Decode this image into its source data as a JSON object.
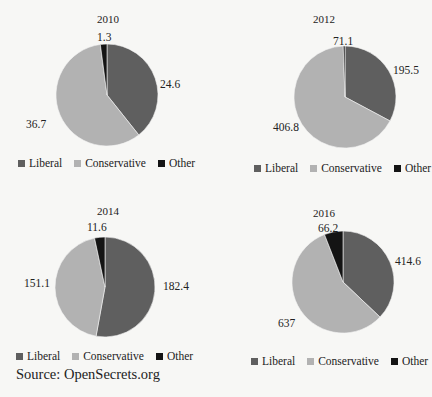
{
  "colors": {
    "liberal": "#5f5f5f",
    "conservative": "#b2b2b2",
    "other": "#141414"
  },
  "legend": {
    "liberal": "Liberal",
    "conservative": "Conservative",
    "other": "Other"
  },
  "source": "Source: OpenSecrets.org",
  "chart_data": [
    {
      "type": "pie",
      "title": "2010",
      "categories": [
        "Liberal",
        "Conservative",
        "Other"
      ],
      "values": [
        24.6,
        36.7,
        1.3
      ],
      "labels": [
        "24.6",
        "36.7",
        "1.3"
      ],
      "legend_position": "bottom"
    },
    {
      "type": "pie",
      "title": "2012",
      "categories": [
        "Liberal",
        "Conservative",
        "Other"
      ],
      "values": [
        195.5,
        406.8,
        71.1
      ],
      "labels": [
        "195.5",
        "406.8",
        "71.1"
      ],
      "legend_position": "bottom"
    },
    {
      "type": "pie",
      "title": "2014",
      "categories": [
        "Liberal",
        "Conservative",
        "Other"
      ],
      "values": [
        182.4,
        151.1,
        11.6
      ],
      "labels": [
        "182.4",
        "151.1",
        "11.6"
      ],
      "legend_position": "bottom"
    },
    {
      "type": "pie",
      "title": "2016",
      "categories": [
        "Liberal",
        "Conservative",
        "Other"
      ],
      "values": [
        414.6,
        637,
        66.2
      ],
      "labels": [
        "414.6",
        "637",
        "66.2"
      ],
      "legend_position": "bottom"
    }
  ],
  "panels": [
    {
      "cx": 107,
      "cy": 95,
      "r": 51,
      "angles": [
        141.5,
        211,
        7.5
      ],
      "title_pos": [
        0,
        13
      ],
      "label_pos": [
        [
          160,
          78
        ],
        [
          26,
          118
        ],
        [
          97,
          31
        ]
      ],
      "legend_pos": [
        18,
        157
      ]
    },
    {
      "cx": 345,
      "cy": 97,
      "r": 51,
      "angles": [
        118,
        240,
        2
      ],
      "title_pos": [
        216,
        13
      ],
      "label_pos": [
        [
          393,
          64
        ],
        [
          273,
          121
        ],
        [
          333,
          35
        ]
      ],
      "legend_pos": [
        254,
        162
      ]
    },
    {
      "cx": 105,
      "cy": 287,
      "r": 50,
      "angles": [
        190.3,
        157.6,
        12.1
      ],
      "title_pos": [
        0,
        205
      ],
      "label_pos": [
        [
          163,
          280
        ],
        [
          24,
          277
        ],
        [
          87,
          221
        ]
      ],
      "legend_pos": [
        16,
        350
      ]
    },
    {
      "cx": 343,
      "cy": 282,
      "r": 51,
      "angles": [
        133.5,
        205.2,
        21.3
      ],
      "title_pos": [
        216,
        207
      ],
      "label_pos": [
        [
          395,
          255
        ],
        [
          278,
          317
        ],
        [
          318,
          222
        ]
      ],
      "legend_pos": [
        251,
        355
      ]
    }
  ]
}
